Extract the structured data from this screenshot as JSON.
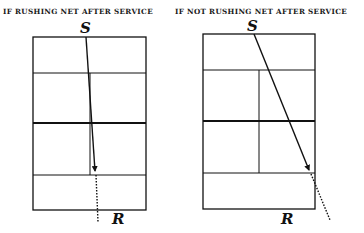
{
  "diagrams": [
    {
      "title": "IF RUSHING NET AFTER SERVICE",
      "server_label": "S",
      "receiver_label": "R"
    },
    {
      "title": "IF NOT RUSHING NET AFTER SERVICE",
      "server_label": "S",
      "receiver_label": "R"
    }
  ],
  "colors": {
    "line": "#111111",
    "background": "#ffffff"
  }
}
